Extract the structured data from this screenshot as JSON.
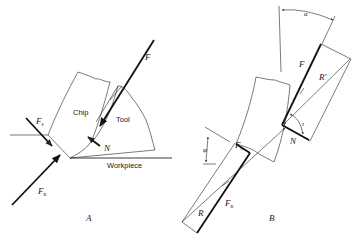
{
  "figure": {
    "panels": [
      {
        "id": "A",
        "label": "A",
        "regions": {
          "chip": "Chip",
          "tool": "Tool",
          "workpiece": "Workpiece"
        },
        "forces": {
          "F": "F",
          "N": "N",
          "Fs_main": "F",
          "Fs_sub": "s",
          "Fn_main": "F",
          "Fn_sub": "n"
        }
      },
      {
        "id": "B",
        "label": "B",
        "forces": {
          "F": "F",
          "N": "N",
          "R": "R",
          "R_prime": "R'",
          "Fs_main": "F",
          "Fs_sub": "s",
          "Fn_main": "F",
          "Fn_sub": "n"
        },
        "angles": {
          "alpha": "α",
          "phi": "φ",
          "tau": "τ"
        }
      }
    ]
  }
}
